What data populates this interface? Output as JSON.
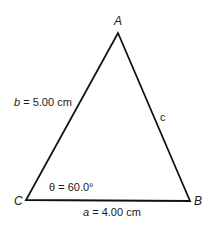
{
  "figure": {
    "type": "triangle",
    "vertices": {
      "A": {
        "label": "A",
        "x": 118,
        "y": 33
      },
      "B": {
        "label": "B",
        "x": 190,
        "y": 201
      },
      "C": {
        "label": "C",
        "x": 26,
        "y": 200
      }
    },
    "sides": {
      "a": {
        "var": "a",
        "text": " = 4.00 cm",
        "from": "C",
        "to": "B"
      },
      "b": {
        "var": "b",
        "text": " = 5.00 cm",
        "from": "C",
        "to": "A"
      },
      "c": {
        "var": "c",
        "text": "",
        "from": "A",
        "to": "B"
      }
    },
    "angle": {
      "symbol": "θ",
      "text": " = 60.0°",
      "at": "C"
    },
    "colors": {
      "stroke": "#111111",
      "background": "#ffffff"
    }
  }
}
